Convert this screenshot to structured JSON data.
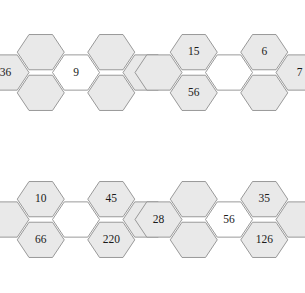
{
  "page": {
    "width": 305,
    "height": 293,
    "background": "#ffffff",
    "hex_fill_color": "#e9e9e9",
    "hex_empty_color": "#ffffff",
    "hex_stroke_color": "#8f8f8f",
    "label_color": "#1a1a1a"
  },
  "figure": {
    "type": "hexagon-flower-puzzle-grid",
    "clusters_across": 2,
    "clusters_down": 2,
    "cells_per_cluster": 7,
    "cell_positions": [
      "upper-left",
      "upper-right",
      "right",
      "lower-right",
      "lower-left",
      "left",
      "center"
    ]
  },
  "clusters": [
    {
      "id": "cluster-top-left",
      "name": "top-left",
      "origin": {
        "x": 0,
        "y": 0
      },
      "cells": [
        {
          "pos": "upper-left",
          "label": "",
          "filled": true
        },
        {
          "pos": "upper-right",
          "label": "",
          "filled": true
        },
        {
          "pos": "right",
          "label": "1",
          "filled": true
        },
        {
          "pos": "lower-right",
          "label": "",
          "filled": true
        },
        {
          "pos": "lower-left",
          "label": "",
          "filled": true
        },
        {
          "pos": "left",
          "label": "36",
          "filled": true
        },
        {
          "pos": "center",
          "label": "9",
          "filled": false
        }
      ]
    },
    {
      "id": "cluster-top-right",
      "name": "top-right",
      "origin": {
        "x": 153,
        "y": 0
      },
      "cells": [
        {
          "pos": "upper-left",
          "label": "15",
          "filled": true
        },
        {
          "pos": "upper-right",
          "label": "6",
          "filled": true
        },
        {
          "pos": "right",
          "label": "7",
          "filled": true
        },
        {
          "pos": "lower-right",
          "label": "",
          "filled": true
        },
        {
          "pos": "lower-left",
          "label": "56",
          "filled": true
        },
        {
          "pos": "left",
          "label": "",
          "filled": true
        },
        {
          "pos": "center",
          "label": "",
          "filled": false
        }
      ]
    },
    {
      "id": "cluster-bottom-left",
      "name": "bottom-left",
      "origin": {
        "x": 0,
        "y": 147
      },
      "cells": [
        {
          "pos": "upper-left",
          "label": "10",
          "filled": true
        },
        {
          "pos": "upper-right",
          "label": "45",
          "filled": true
        },
        {
          "pos": "right",
          "label": "",
          "filled": true
        },
        {
          "pos": "lower-right",
          "label": "220",
          "filled": true
        },
        {
          "pos": "lower-left",
          "label": "66",
          "filled": true
        },
        {
          "pos": "left",
          "label": "",
          "filled": true
        },
        {
          "pos": "center",
          "label": "",
          "filled": false
        }
      ]
    },
    {
      "id": "cluster-bottom-right",
      "name": "bottom-right",
      "origin": {
        "x": 153,
        "y": 147
      },
      "cells": [
        {
          "pos": "upper-left",
          "label": "",
          "filled": true
        },
        {
          "pos": "upper-right",
          "label": "35",
          "filled": true
        },
        {
          "pos": "right",
          "label": "",
          "filled": true
        },
        {
          "pos": "lower-right",
          "label": "126",
          "filled": true
        },
        {
          "pos": "lower-left",
          "label": "",
          "filled": true
        },
        {
          "pos": "left",
          "label": "28",
          "filled": true
        },
        {
          "pos": "center",
          "label": "56",
          "filled": false
        }
      ]
    }
  ]
}
